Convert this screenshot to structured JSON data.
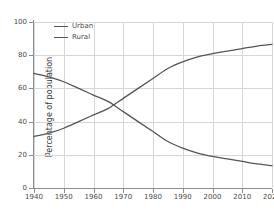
{
  "chart_data": {
    "type": "line",
    "title": "",
    "subtitle": "",
    "xlabel": "",
    "ylabel": "Percentage of population",
    "xlim": [
      1940,
      2020
    ],
    "ylim": [
      0,
      100
    ],
    "grid": true,
    "legend_position": "upper left (inside axes)",
    "x_ticks": [
      1940,
      1950,
      1960,
      1970,
      1980,
      1990,
      2000,
      2010,
      2020
    ],
    "x_tick_labels": [
      "1940",
      "1950",
      "1960",
      "1970",
      "1980",
      "1990",
      "2000",
      "2010",
      "2020"
    ],
    "y_ticks": [
      0,
      20,
      40,
      60,
      80,
      100
    ],
    "y_tick_labels": [
      "0",
      "20",
      "40",
      "60",
      "80",
      "100"
    ],
    "x": [
      1940,
      1945,
      1950,
      1955,
      1960,
      1965,
      1970,
      1975,
      1980,
      1985,
      1990,
      1995,
      2000,
      2005,
      2010,
      2015,
      2020
    ],
    "series": [
      {
        "name": "Urban",
        "color": "#555555",
        "values": [
          31,
          33,
          36,
          40,
          44,
          48,
          54,
          60,
          66,
          72,
          76,
          79,
          81,
          82.5,
          84,
          85.5,
          86.5
        ]
      },
      {
        "name": "Rural",
        "color": "#555555",
        "values": [
          69,
          67,
          64,
          60,
          56,
          52,
          46,
          40,
          34,
          28,
          24,
          21,
          19,
          17.5,
          16,
          14.5,
          13.5
        ]
      }
    ],
    "annotations": [
      "Urban and Rural curves cross at approximately 1967 at 50 percent"
    ]
  },
  "legend": {
    "entries": [
      {
        "label": "Urban"
      },
      {
        "label": "Rural"
      }
    ]
  },
  "colors": {
    "line": "#555555",
    "grid": "#d7d7d7",
    "spine": "#8d8d8d",
    "text": "#4a4a4a",
    "background": "#ffffff"
  }
}
